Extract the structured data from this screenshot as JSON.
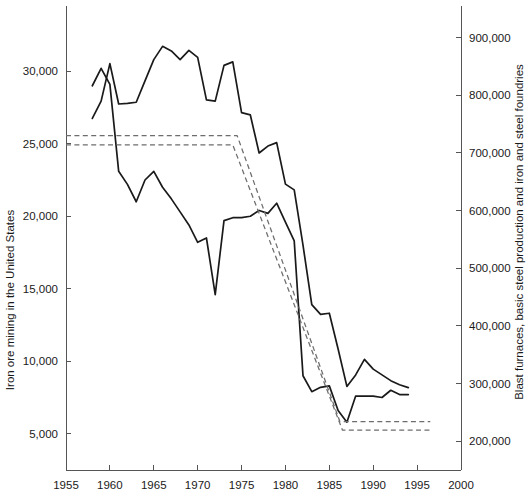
{
  "chart_data": {
    "type": "line",
    "title": "",
    "xlabel": "",
    "ylabel": "Iron ore mining in the United States",
    "y2label": "Blast furnaces, basic steel production and iron and steel foundries",
    "xlim": [
      1955,
      2000
    ],
    "ylim": [
      2500,
      34500
    ],
    "y2lim": [
      150000,
      955000
    ],
    "grid": false,
    "legend_position": "none",
    "xticks": [
      1955,
      1960,
      1965,
      1970,
      1975,
      1980,
      1985,
      1990,
      1995,
      2000
    ],
    "xticklabels": [
      "1955",
      "1960",
      "1965",
      "1970",
      "1975",
      "1980",
      "1985",
      "1990",
      "1995",
      "2000"
    ],
    "yticks": [
      5000,
      10000,
      15000,
      20000,
      25000,
      30000
    ],
    "yticklabels": [
      "5,000",
      "10,000",
      "15,000",
      "20,000",
      "25,000",
      "30,000"
    ],
    "y2ticks": [
      200000,
      300000,
      400000,
      500000,
      600000,
      700000,
      800000,
      900000
    ],
    "y2ticklabels": [
      "200,000",
      "300,000",
      "400,000",
      "500,000",
      "600,000",
      "700,000",
      "800,000",
      "900,000"
    ],
    "series": [
      {
        "name": "Iron ore mining in the United States",
        "axis": "left",
        "style": "solid",
        "x": [
          1958,
          1959,
          1960,
          1961,
          1962,
          1963,
          1964,
          1965,
          1966,
          1967,
          1968,
          1969,
          1970,
          1971,
          1972,
          1973,
          1974,
          1975,
          1976,
          1977,
          1978,
          1979,
          1980,
          1981,
          1982,
          1983,
          1984,
          1985,
          1986,
          1987,
          1988,
          1989,
          1990,
          1991,
          1992,
          1993,
          1994
        ],
        "values": [
          29000,
          30200,
          29100,
          23100,
          22200,
          21000,
          22500,
          23100,
          22000,
          21200,
          20300,
          19400,
          18200,
          18500,
          14600,
          19700,
          19900,
          19900,
          20000,
          20400,
          20200,
          20900,
          19600,
          18300,
          9000,
          7900,
          8200,
          8300,
          6600,
          5800,
          7600,
          7600,
          7600,
          7500,
          8000,
          7700,
          7700
        ]
      },
      {
        "name": "Blast furnaces, basic steel production and iron and steel foundries",
        "axis": "right",
        "style": "solid",
        "x": [
          1958,
          1959,
          1960,
          1961,
          1962,
          1963,
          1964,
          1965,
          1966,
          1967,
          1968,
          1969,
          1970,
          1971,
          1972,
          1973,
          1974,
          1975,
          1976,
          1977,
          1978,
          1979,
          1980,
          1981,
          1982,
          1983,
          1984,
          1985,
          1986,
          1987,
          1988,
          1989,
          1990,
          1991,
          1992,
          1993,
          1994
        ],
        "values": [
          760000,
          790000,
          855000,
          785000,
          786000,
          788000,
          825000,
          862000,
          885000,
          877000,
          862000,
          878000,
          866000,
          792000,
          790000,
          852000,
          858000,
          770000,
          766000,
          700000,
          712000,
          718000,
          646000,
          636000,
          540000,
          437000,
          420000,
          422000,
          360000,
          295000,
          315000,
          342000,
          325000,
          315000,
          305000,
          298000,
          293000
        ]
      },
      {
        "name": "Dashed reference band upper",
        "axis": "right",
        "style": "dashed",
        "x": [
          1955,
          1974.5,
          1986.2,
          1996.5
        ],
        "values": [
          730000,
          730000,
          234000,
          234000
        ]
      },
      {
        "name": "Dashed reference band lower",
        "axis": "right",
        "style": "dashed",
        "x": [
          1955,
          1974.0,
          1986.5,
          1996.5
        ],
        "values": [
          714000,
          714000,
          219000,
          219000
        ]
      }
    ]
  },
  "axes": {
    "left_title": "Iron ore mining in the United States",
    "right_title": "Blast furnaces, basic steel production and iron and steel foundries"
  }
}
